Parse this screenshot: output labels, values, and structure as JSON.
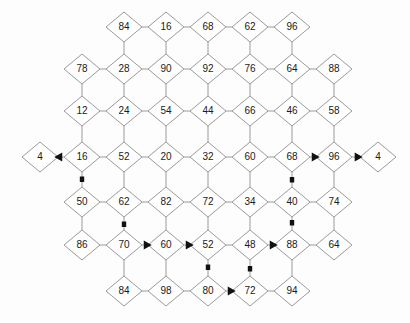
{
  "diagram": {
    "type": "node-link-lattice",
    "node_shape": "diamond",
    "colors": {
      "node_fill": "#ffffff",
      "node_stroke": "#9a9a9a",
      "edge": "#9a9a9a",
      "label": "#1a1a1a",
      "highlight_path": "#111111",
      "background": "#fdfdfd"
    },
    "geometry": {
      "cell_width": 42,
      "cell_height": 42,
      "diamond_half_width": 18,
      "diamond_half_height": 15,
      "origin_x": 40,
      "origin_y": 27
    },
    "rows": [
      {
        "index": 0,
        "y": 27,
        "nodes": [
          {
            "col": 2,
            "x": 124,
            "label": "84"
          },
          {
            "col": 3,
            "x": 166,
            "label": "16"
          },
          {
            "col": 4,
            "x": 208,
            "label": "68"
          },
          {
            "col": 5,
            "x": 250,
            "label": "62"
          },
          {
            "col": 6,
            "x": 292,
            "label": "96"
          }
        ]
      },
      {
        "index": 1,
        "y": 69,
        "nodes": [
          {
            "col": 1,
            "x": 82,
            "label": "78"
          },
          {
            "col": 2,
            "x": 124,
            "label": "28"
          },
          {
            "col": 3,
            "x": 166,
            "label": "90"
          },
          {
            "col": 4,
            "x": 208,
            "label": "92"
          },
          {
            "col": 5,
            "x": 250,
            "label": "76"
          },
          {
            "col": 6,
            "x": 292,
            "label": "64"
          },
          {
            "col": 7,
            "x": 334,
            "label": "88"
          }
        ]
      },
      {
        "index": 2,
        "y": 111,
        "nodes": [
          {
            "col": 1,
            "x": 82,
            "label": "12"
          },
          {
            "col": 2,
            "x": 124,
            "label": "24"
          },
          {
            "col": 3,
            "x": 166,
            "label": "54"
          },
          {
            "col": 4,
            "x": 208,
            "label": "44"
          },
          {
            "col": 5,
            "x": 250,
            "label": "66"
          },
          {
            "col": 6,
            "x": 292,
            "label": "46"
          },
          {
            "col": 7,
            "x": 334,
            "label": "58"
          }
        ]
      },
      {
        "index": 3,
        "y": 157,
        "nodes": [
          {
            "col": 0,
            "x": 40,
            "label": "4"
          },
          {
            "col": 1,
            "x": 82,
            "label": "16"
          },
          {
            "col": 2,
            "x": 124,
            "label": "52"
          },
          {
            "col": 3,
            "x": 166,
            "label": "20"
          },
          {
            "col": 4,
            "x": 208,
            "label": "32"
          },
          {
            "col": 5,
            "x": 250,
            "label": "60"
          },
          {
            "col": 6,
            "x": 292,
            "label": "68"
          },
          {
            "col": 7,
            "x": 334,
            "label": "96"
          },
          {
            "col": 8,
            "x": 378,
            "label": "4"
          }
        ]
      },
      {
        "index": 4,
        "y": 202,
        "nodes": [
          {
            "col": 1,
            "x": 82,
            "label": "50"
          },
          {
            "col": 2,
            "x": 124,
            "label": "62"
          },
          {
            "col": 3,
            "x": 166,
            "label": "82"
          },
          {
            "col": 4,
            "x": 208,
            "label": "72"
          },
          {
            "col": 5,
            "x": 250,
            "label": "34"
          },
          {
            "col": 6,
            "x": 292,
            "label": "40"
          },
          {
            "col": 7,
            "x": 334,
            "label": "74"
          }
        ]
      },
      {
        "index": 5,
        "y": 245,
        "nodes": [
          {
            "col": 1,
            "x": 82,
            "label": "86"
          },
          {
            "col": 2,
            "x": 124,
            "label": "70"
          },
          {
            "col": 3,
            "x": 166,
            "label": "60"
          },
          {
            "col": 4,
            "x": 208,
            "label": "52"
          },
          {
            "col": 5,
            "x": 250,
            "label": "48"
          },
          {
            "col": 6,
            "x": 292,
            "label": "88"
          },
          {
            "col": 7,
            "x": 334,
            "label": "64"
          }
        ]
      },
      {
        "index": 6,
        "y": 291,
        "nodes": [
          {
            "col": 2,
            "x": 124,
            "label": "84"
          },
          {
            "col": 3,
            "x": 166,
            "label": "98"
          },
          {
            "col": 4,
            "x": 208,
            "label": "80"
          },
          {
            "col": 5,
            "x": 250,
            "label": "72"
          },
          {
            "col": 6,
            "x": 292,
            "label": "94"
          }
        ]
      }
    ],
    "lattice_edges": [
      [
        124,
        27,
        166,
        27
      ],
      [
        166,
        27,
        208,
        27
      ],
      [
        208,
        27,
        250,
        27
      ],
      [
        250,
        27,
        292,
        27
      ],
      [
        124,
        27,
        124,
        69
      ],
      [
        166,
        27,
        166,
        69
      ],
      [
        208,
        27,
        208,
        69
      ],
      [
        250,
        27,
        250,
        69
      ],
      [
        292,
        27,
        292,
        69
      ],
      [
        82,
        69,
        124,
        69
      ],
      [
        124,
        69,
        166,
        69
      ],
      [
        166,
        69,
        208,
        69
      ],
      [
        208,
        69,
        250,
        69
      ],
      [
        250,
        69,
        292,
        69
      ],
      [
        292,
        69,
        334,
        69
      ],
      [
        82,
        69,
        82,
        111
      ],
      [
        124,
        69,
        124,
        111
      ],
      [
        166,
        69,
        166,
        111
      ],
      [
        208,
        69,
        208,
        111
      ],
      [
        250,
        69,
        250,
        111
      ],
      [
        292,
        69,
        292,
        111
      ],
      [
        334,
        69,
        334,
        111
      ],
      [
        82,
        111,
        124,
        111
      ],
      [
        124,
        111,
        166,
        111
      ],
      [
        166,
        111,
        208,
        111
      ],
      [
        208,
        111,
        250,
        111
      ],
      [
        250,
        111,
        292,
        111
      ],
      [
        292,
        111,
        334,
        111
      ],
      [
        82,
        111,
        82,
        157
      ],
      [
        124,
        111,
        124,
        157
      ],
      [
        166,
        111,
        166,
        157
      ],
      [
        208,
        111,
        208,
        157
      ],
      [
        250,
        111,
        250,
        157
      ],
      [
        292,
        111,
        292,
        157
      ],
      [
        334,
        111,
        334,
        157
      ],
      [
        40,
        157,
        82,
        157
      ],
      [
        82,
        157,
        124,
        157
      ],
      [
        124,
        157,
        166,
        157
      ],
      [
        166,
        157,
        208,
        157
      ],
      [
        208,
        157,
        250,
        157
      ],
      [
        250,
        157,
        292,
        157
      ],
      [
        292,
        157,
        334,
        157
      ],
      [
        334,
        157,
        378,
        157
      ],
      [
        82,
        157,
        82,
        202
      ],
      [
        124,
        157,
        124,
        202
      ],
      [
        166,
        157,
        166,
        202
      ],
      [
        208,
        157,
        208,
        202
      ],
      [
        250,
        157,
        250,
        202
      ],
      [
        292,
        157,
        292,
        202
      ],
      [
        334,
        157,
        334,
        202
      ],
      [
        82,
        202,
        124,
        202
      ],
      [
        124,
        202,
        166,
        202
      ],
      [
        166,
        202,
        208,
        202
      ],
      [
        208,
        202,
        250,
        202
      ],
      [
        250,
        202,
        292,
        202
      ],
      [
        292,
        202,
        334,
        202
      ],
      [
        82,
        202,
        82,
        245
      ],
      [
        124,
        202,
        124,
        245
      ],
      [
        166,
        202,
        166,
        245
      ],
      [
        208,
        202,
        208,
        245
      ],
      [
        250,
        202,
        250,
        245
      ],
      [
        292,
        202,
        292,
        245
      ],
      [
        334,
        202,
        334,
        245
      ],
      [
        82,
        245,
        124,
        245
      ],
      [
        124,
        245,
        166,
        245
      ],
      [
        166,
        245,
        208,
        245
      ],
      [
        208,
        245,
        250,
        245
      ],
      [
        250,
        245,
        292,
        245
      ],
      [
        292,
        245,
        334,
        245
      ],
      [
        124,
        245,
        124,
        291
      ],
      [
        166,
        245,
        166,
        291
      ],
      [
        208,
        245,
        208,
        291
      ],
      [
        250,
        245,
        250,
        291
      ],
      [
        292,
        245,
        292,
        291
      ],
      [
        124,
        291,
        166,
        291
      ],
      [
        166,
        291,
        208,
        291
      ],
      [
        208,
        291,
        250,
        291
      ],
      [
        250,
        291,
        292,
        291
      ]
    ],
    "highlight_path": {
      "description": "Bold routed path overlaid on the lattice",
      "segments": [
        {
          "x1": 82,
          "y1": 157,
          "x2": 40,
          "y2": 157,
          "arrow": "left"
        },
        {
          "x1": 82,
          "y1": 157,
          "x2": 82,
          "y2": 202,
          "arrow": "none"
        },
        {
          "x1": 82,
          "y1": 202,
          "x2": 124,
          "y2": 202,
          "arrow": "none"
        },
        {
          "x1": 124,
          "y1": 202,
          "x2": 124,
          "y2": 245,
          "arrow": "none"
        },
        {
          "x1": 124,
          "y1": 245,
          "x2": 166,
          "y2": 245,
          "arrow": "right"
        },
        {
          "x1": 166,
          "y1": 245,
          "x2": 208,
          "y2": 245,
          "arrow": "right"
        },
        {
          "x1": 208,
          "y1": 245,
          "x2": 208,
          "y2": 291,
          "arrow": "none"
        },
        {
          "x1": 208,
          "y1": 291,
          "x2": 250,
          "y2": 291,
          "arrow": "right"
        },
        {
          "x1": 250,
          "y1": 291,
          "x2": 250,
          "y2": 245,
          "arrow": "none"
        },
        {
          "x1": 250,
          "y1": 245,
          "x2": 292,
          "y2": 245,
          "arrow": "right"
        },
        {
          "x1": 292,
          "y1": 245,
          "x2": 292,
          "y2": 202,
          "arrow": "none"
        },
        {
          "x1": 292,
          "y1": 202,
          "x2": 292,
          "y2": 157,
          "arrow": "none"
        },
        {
          "x1": 292,
          "y1": 157,
          "x2": 334,
          "y2": 157,
          "arrow": "right"
        },
        {
          "x1": 334,
          "y1": 157,
          "x2": 378,
          "y2": 157,
          "arrow": "right"
        }
      ]
    }
  }
}
